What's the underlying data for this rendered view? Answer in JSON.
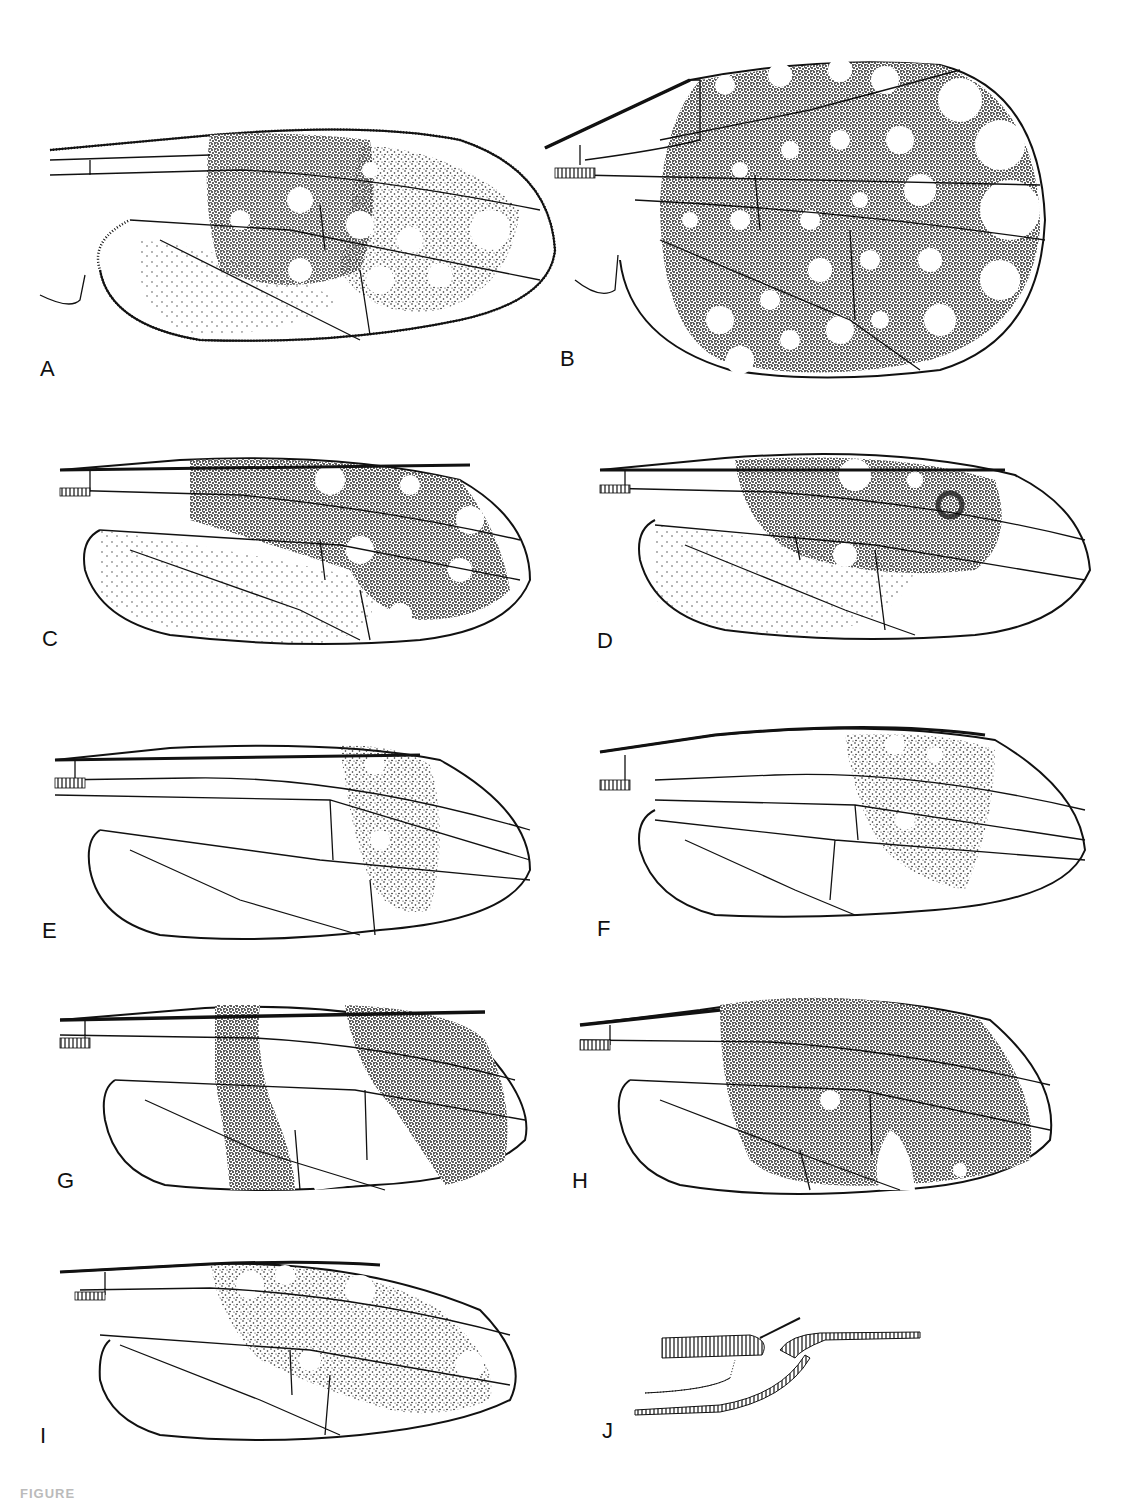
{
  "figure": {
    "caption_fragment": "FIGURE",
    "panels": [
      {
        "id": "A",
        "label": "A",
        "pattern": "sparse spots, marginal setae"
      },
      {
        "id": "B",
        "label": "B",
        "pattern": "dense with many hyaline spots"
      },
      {
        "id": "C",
        "label": "C",
        "pattern": "central dark area, few spots"
      },
      {
        "id": "D",
        "label": "D",
        "pattern": "central dark area with ocellus"
      },
      {
        "id": "E",
        "label": "E",
        "pattern": "pale, apical band"
      },
      {
        "id": "F",
        "label": "F",
        "pattern": "pale, apical band"
      },
      {
        "id": "G",
        "label": "G",
        "pattern": "two dark transverse bands"
      },
      {
        "id": "H",
        "label": "H",
        "pattern": "extensively dark with small spots"
      },
      {
        "id": "I",
        "label": "I",
        "pattern": "mid dark area with spots"
      },
      {
        "id": "J",
        "label": "J",
        "pattern": "detail of wing base venation"
      }
    ]
  }
}
